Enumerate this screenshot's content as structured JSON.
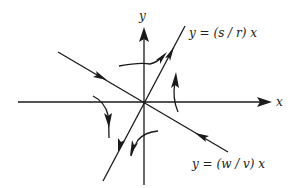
{
  "diagram": {
    "type": "phase-portrait",
    "axes": {
      "x_label": "x",
      "y_label": "y"
    },
    "lines": [
      {
        "id": "unstable",
        "label": "y = (s / r) x",
        "direction": "outward"
      },
      {
        "id": "stable",
        "label": "y = (w / v) x",
        "direction": "inward"
      }
    ],
    "colors": {
      "stroke": "#1a1a1a",
      "text": "#222222",
      "background": "#ffffff"
    }
  }
}
